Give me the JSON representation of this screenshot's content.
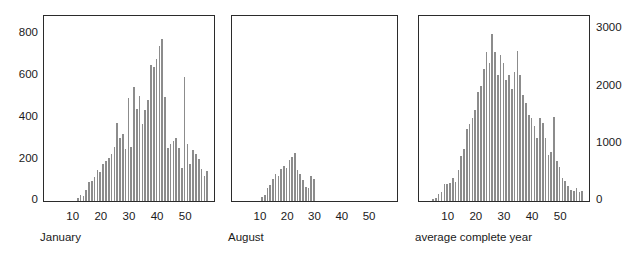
{
  "figure": {
    "width": 634,
    "height": 261,
    "background": "#ffffff",
    "bar_color": "#8c8c8c",
    "axis_color": "#2b2b2b",
    "text_color": "#1a1a1a"
  },
  "chart_data": [
    {
      "type": "bar",
      "title": "",
      "subtitle": "",
      "panel_label": "January",
      "xlabel": "",
      "ylabel": "",
      "grid": false,
      "legend": null,
      "y_axis_side": "left",
      "xlim": [
        0,
        60
      ],
      "ylim": [
        0,
        880
      ],
      "yticks": [
        0,
        200,
        400,
        600,
        800
      ],
      "ytick_labels": [
        "0",
        "200",
        "400",
        "600",
        "800"
      ],
      "xticks": [
        10,
        20,
        30,
        40,
        50
      ],
      "xtick_labels": [
        "10",
        "20",
        "30",
        "40",
        "50"
      ],
      "x": [
        1,
        2,
        3,
        4,
        5,
        6,
        7,
        8,
        9,
        10,
        11,
        12,
        13,
        14,
        15,
        16,
        17,
        18,
        19,
        20,
        21,
        22,
        23,
        24,
        25,
        26,
        27,
        28,
        29,
        30,
        31,
        32,
        33,
        34,
        35,
        36,
        37,
        38,
        39,
        40,
        41,
        42,
        43,
        44,
        45,
        46,
        47,
        48,
        49,
        50,
        51,
        52,
        53,
        54,
        55,
        56,
        57,
        58
      ],
      "values": [
        0,
        0,
        0,
        0,
        0,
        0,
        0,
        0,
        0,
        0,
        0,
        15,
        30,
        25,
        55,
        90,
        95,
        115,
        150,
        140,
        175,
        190,
        205,
        225,
        260,
        375,
        300,
        320,
        250,
        495,
        260,
        545,
        440,
        505,
        370,
        435,
        485,
        650,
        640,
        680,
        740,
        775,
        500,
        255,
        275,
        285,
        300,
        255,
        160,
        595,
        275,
        175,
        245,
        225,
        200,
        155,
        120,
        145
      ]
    },
    {
      "type": "bar",
      "title": "",
      "subtitle": "",
      "panel_label": "August",
      "xlabel": "",
      "ylabel": "",
      "grid": false,
      "legend": null,
      "y_axis_side": "none",
      "xlim": [
        0,
        60
      ],
      "ylim": [
        0,
        880
      ],
      "yticks": [],
      "ytick_labels": [],
      "xticks": [
        10,
        20,
        30,
        40,
        50
      ],
      "xtick_labels": [
        "10",
        "20",
        "30",
        "40",
        "50"
      ],
      "x": [
        1,
        2,
        3,
        4,
        5,
        6,
        7,
        8,
        9,
        10,
        11,
        12,
        13,
        14,
        15,
        16,
        17,
        18,
        19,
        20,
        21,
        22,
        23,
        24,
        25,
        26,
        27,
        28,
        29,
        30,
        31,
        32,
        33,
        34,
        35,
        36,
        37,
        38,
        39,
        40,
        41,
        42,
        43,
        44,
        45,
        46,
        47,
        48,
        49,
        50,
        51,
        52,
        53,
        54,
        55,
        56,
        57,
        58
      ],
      "values": [
        0,
        0,
        0,
        0,
        0,
        0,
        0,
        0,
        0,
        0,
        20,
        30,
        60,
        75,
        105,
        130,
        120,
        155,
        170,
        160,
        195,
        210,
        230,
        150,
        130,
        100,
        65,
        60,
        120,
        105,
        0,
        0,
        0,
        0,
        0,
        0,
        0,
        0,
        0,
        0,
        0,
        0,
        0,
        0,
        0,
        0,
        0,
        0,
        0,
        0,
        0,
        0,
        0,
        0,
        0,
        0,
        0,
        0
      ]
    },
    {
      "type": "bar",
      "title": "",
      "subtitle": "",
      "panel_label": "average complete year",
      "xlabel": "",
      "ylabel": "",
      "grid": false,
      "legend": null,
      "y_axis_side": "right",
      "xlim": [
        0,
        60
      ],
      "ylim": [
        0,
        3200
      ],
      "yticks": [
        0,
        1000,
        2000,
        3000
      ],
      "ytick_labels": [
        "0",
        "1000",
        "2000",
        "3000"
      ],
      "xticks": [
        10,
        20,
        30,
        40,
        50
      ],
      "xtick_labels": [
        "10",
        "20",
        "30",
        "40",
        "50"
      ],
      "x": [
        1,
        2,
        3,
        4,
        5,
        6,
        7,
        8,
        9,
        10,
        11,
        12,
        13,
        14,
        15,
        16,
        17,
        18,
        19,
        20,
        21,
        22,
        23,
        24,
        25,
        26,
        27,
        28,
        29,
        30,
        31,
        32,
        33,
        34,
        35,
        36,
        37,
        38,
        39,
        40,
        41,
        42,
        43,
        44,
        45,
        46,
        47,
        48,
        49,
        50,
        51,
        52,
        53,
        54,
        55,
        56,
        57,
        58
      ],
      "values": [
        0,
        0,
        0,
        0,
        40,
        60,
        130,
        160,
        290,
        300,
        320,
        400,
        330,
        540,
        790,
        900,
        1250,
        1340,
        1450,
        1580,
        1900,
        2000,
        2300,
        2600,
        2400,
        2900,
        2600,
        2200,
        2550,
        2400,
        2100,
        2200,
        1950,
        2250,
        2620,
        2200,
        1850,
        1700,
        1500,
        1450,
        1300,
        1100,
        1450,
        1350,
        1100,
        800,
        850,
        1460,
        700,
        600,
        400,
        340,
        260,
        200,
        180,
        230,
        160,
        170
      ]
    }
  ],
  "panels": [
    {
      "name": "january",
      "frame": {
        "left": 43,
        "top": 15,
        "width": 172,
        "height": 187
      },
      "caption_pos": {
        "left": 40,
        "top": 232
      },
      "xtick_label_y": 211,
      "ylabel_x_right": 38,
      "chart_index": 0
    },
    {
      "name": "august",
      "frame": {
        "left": 231,
        "top": 15,
        "width": 167,
        "height": 187
      },
      "caption_pos": {
        "left": 228,
        "top": 232
      },
      "xtick_label_y": 211,
      "ylabel_x_right": 0,
      "chart_index": 1
    },
    {
      "name": "average-complete-year",
      "frame": {
        "left": 418,
        "top": 15,
        "width": 172,
        "height": 187
      },
      "caption_pos": {
        "left": 415,
        "top": 232
      },
      "xtick_label_y": 211,
      "ylabel_x_left": 596,
      "chart_index": 2
    }
  ]
}
